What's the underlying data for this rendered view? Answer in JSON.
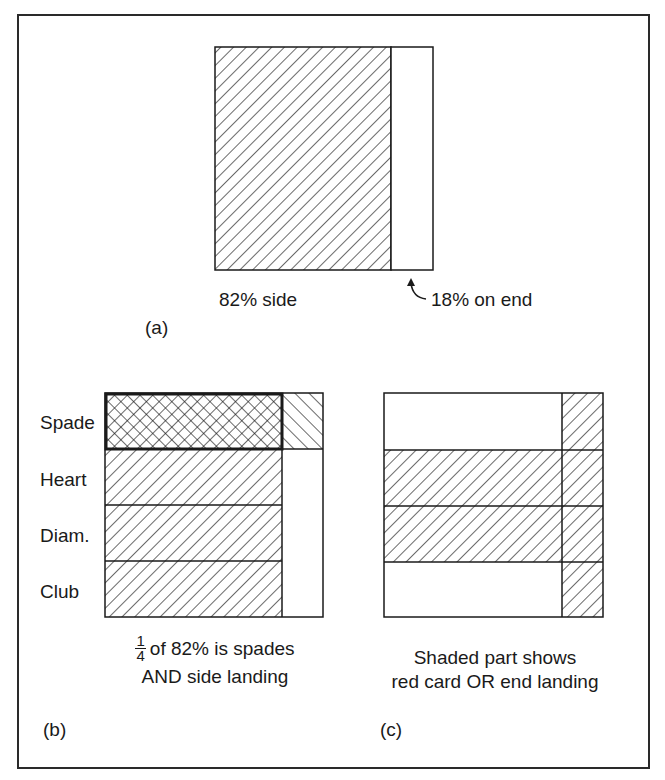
{
  "figure": {
    "panel_a": {
      "tag": "(a)",
      "side_label": "82% side",
      "end_label": "18% on end",
      "side_fraction": 0.82,
      "end_fraction": 0.18
    },
    "panel_b": {
      "tag": "(b)",
      "rows": [
        {
          "label": "Spade",
          "side": "crosshatch-highlight",
          "end": "backslash-hatch"
        },
        {
          "label": "Heart",
          "side": "hatch",
          "end": "blank"
        },
        {
          "label": "Diam.",
          "side": "hatch",
          "end": "blank"
        },
        {
          "label": "Club",
          "side": "hatch",
          "end": "blank"
        }
      ],
      "caption_fraction_num": "1",
      "caption_fraction_den": "4",
      "caption_line1": "of 82% is spades",
      "caption_line2": "AND side landing"
    },
    "panel_c": {
      "tag": "(c)",
      "rows": [
        {
          "label": "Spade",
          "side": "blank",
          "end": "hatch"
        },
        {
          "label": "Heart",
          "side": "hatch",
          "end": "hatch"
        },
        {
          "label": "Diam.",
          "side": "hatch",
          "end": "hatch"
        },
        {
          "label": "Club",
          "side": "blank",
          "end": "hatch"
        }
      ],
      "caption_line1": "Shaded part shows",
      "caption_line2": "red card OR end landing"
    }
  },
  "colors": {
    "ink": "#1a1a1a",
    "paper": "#ffffff"
  }
}
